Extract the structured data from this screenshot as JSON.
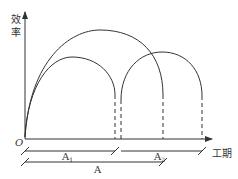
{
  "diagram": {
    "y_axis_label": "效率",
    "x_axis_label": "工期",
    "origin_label": "O",
    "segments": [
      {
        "label": "A",
        "sub": "1"
      },
      {
        "label": "A",
        "sub": "2"
      },
      {
        "label": "A",
        "sub": ""
      }
    ],
    "colors": {
      "line": "#333333",
      "background": "#ffffff"
    }
  }
}
